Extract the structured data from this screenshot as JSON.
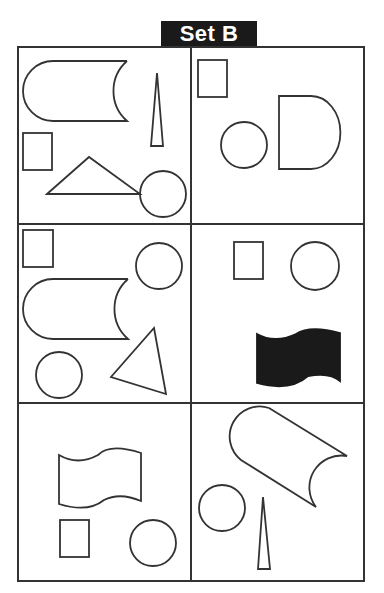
{
  "title": "Set B",
  "grid": {
    "rows": 3,
    "cols": 2,
    "line_color": "#333333",
    "fill_color": "#1a1a1a"
  },
  "panels": [
    {
      "id": "r1c1",
      "shapes": [
        "cylinder-horizontal",
        "thin-triangle",
        "square",
        "triangle",
        "circle"
      ]
    },
    {
      "id": "r1c2",
      "shapes": [
        "square",
        "circle",
        "d-shape"
      ]
    },
    {
      "id": "r2c1",
      "shapes": [
        "square",
        "circle",
        "cylinder-horizontal",
        "circle",
        "triangle"
      ]
    },
    {
      "id": "r2c2",
      "shapes": [
        "square",
        "circle",
        "wave-banner-filled"
      ]
    },
    {
      "id": "r3c1",
      "shapes": [
        "wave-banner",
        "square",
        "circle"
      ]
    },
    {
      "id": "r3c2",
      "shapes": [
        "cylinder-tilted",
        "circle",
        "thin-triangle"
      ]
    }
  ]
}
